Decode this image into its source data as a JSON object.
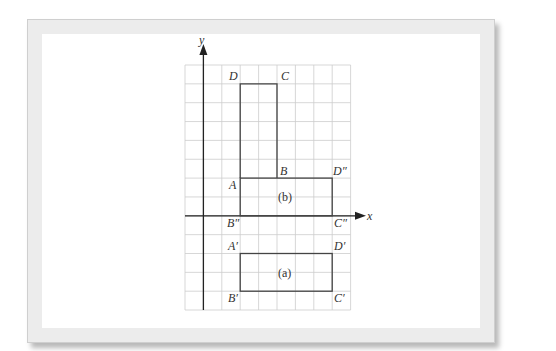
{
  "figure": {
    "axes": {
      "x_label": "x",
      "y_label": "y"
    },
    "grid": {
      "columns": 9,
      "rows": 13,
      "cell_size": 1
    },
    "shapes": [
      {
        "name": "original",
        "vertices": [
          "A",
          "B",
          "C",
          "D"
        ]
      },
      {
        "name": "b",
        "caption": "(b)",
        "vertices": [
          "A",
          "D″",
          "C″",
          "B″"
        ]
      },
      {
        "name": "a",
        "caption": "(a)",
        "vertices": [
          "A′",
          "D′",
          "C′",
          "B′"
        ]
      }
    ],
    "labels": {
      "D": "D",
      "C": "C",
      "B": "B",
      "A": "A",
      "D2": "D″",
      "B2": "B″",
      "C2": "C″",
      "A1": "A′",
      "D1": "D′",
      "B1": "B′",
      "C1": "C′",
      "cap_b": "(b)",
      "cap_a": "(a)"
    },
    "colors": {
      "grid_line": "#c8c8c8",
      "axis": "#222222",
      "shape_stroke": "#444444",
      "frame": "#ececec"
    }
  }
}
